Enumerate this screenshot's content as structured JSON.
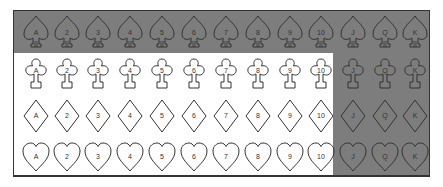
{
  "ranks": [
    "A",
    "2",
    "3",
    "4",
    "5",
    "6",
    "7",
    "8",
    "9",
    "10",
    "J",
    "Q",
    "K"
  ],
  "suits": [
    {
      "name": "spades",
      "ranks": [
        "A",
        "2",
        "3",
        "4",
        "5",
        "6",
        "7",
        "8",
        "9",
        "10",
        "J",
        "Q",
        "K"
      ],
      "highlighted": "all"
    },
    {
      "name": "clubs",
      "ranks": [
        "A",
        "2",
        "3",
        "4",
        "5",
        "6",
        "7",
        "8",
        "9",
        "10",
        "J",
        "Q",
        "K"
      ],
      "highlighted": [
        "J",
        "Q",
        "K"
      ]
    },
    {
      "name": "diamonds",
      "ranks": [
        "A",
        "2",
        "3",
        "4",
        "5",
        "6",
        "7",
        "8",
        "9",
        "10",
        "J",
        "Q",
        "K"
      ],
      "highlighted": [
        "J",
        "Q",
        "K"
      ]
    },
    {
      "name": "hearts",
      "ranks": [
        "A",
        "2",
        "3",
        "4",
        "5",
        "6",
        "7",
        "8",
        "9",
        "10",
        "J",
        "Q",
        "K"
      ],
      "highlighted": [
        "J",
        "Q",
        "K"
      ]
    }
  ],
  "colors": {
    "highlight": "#7d7d7d",
    "outline": "#333333",
    "background": "#ffffff"
  }
}
